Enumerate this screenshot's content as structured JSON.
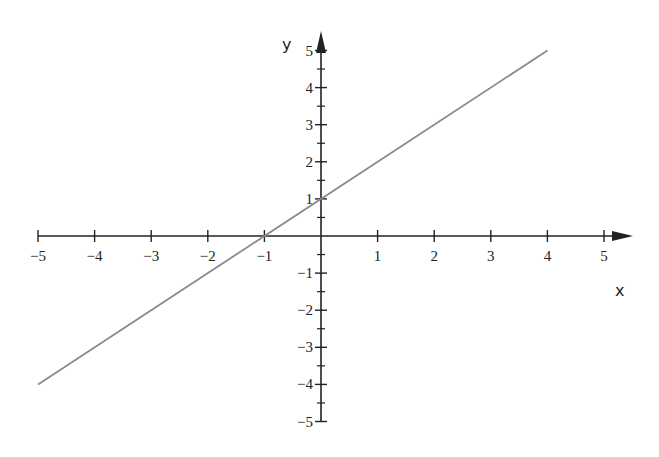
{
  "chart_data": {
    "type": "line",
    "title": "",
    "xlabel": "x",
    "ylabel": "y",
    "xlim": [
      -5,
      5
    ],
    "ylim": [
      -5,
      5
    ],
    "grid": false,
    "legend": null,
    "x_ticks": [
      -5,
      -4,
      -3,
      -2,
      -1,
      1,
      2,
      3,
      4,
      5
    ],
    "x_tick_labels": [
      "−5",
      "−4",
      "−3",
      "−2",
      "−1",
      "1",
      "2",
      "3",
      "4",
      "5"
    ],
    "y_ticks": [
      -5,
      -4,
      -3,
      -2,
      -1,
      1,
      2,
      3,
      4,
      5
    ],
    "y_tick_labels": [
      "−5",
      "−4",
      "−3",
      "−2",
      "−1",
      "1",
      "2",
      "3",
      "4",
      "5"
    ],
    "y_minor_ticks": [
      -4.5,
      -3.5,
      -2.5,
      -1.5,
      -0.5,
      0.5,
      1.5,
      2.5,
      3.5,
      4.5
    ],
    "series": [
      {
        "name": "y = x + 1",
        "x": [
          -5,
          4
        ],
        "y": [
          -4,
          5
        ],
        "color": "#8a8a8a"
      }
    ],
    "axis_color": "#222222"
  }
}
